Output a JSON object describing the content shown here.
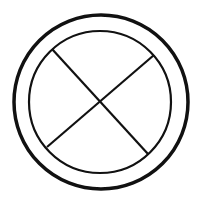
{
  "diagram": {
    "colors": {
      "stroke": "#111111",
      "background": "#ffffff"
    },
    "outer_circle": {
      "cx": 101,
      "cy": 102,
      "r": 87,
      "stroke_width": 3.5
    },
    "inner_circle": {
      "cx": 100,
      "cy": 102,
      "r": 71,
      "stroke_width": 2.2
    },
    "lines": [
      {
        "x1": 52,
        "y1": 49,
        "x2": 148,
        "y2": 154,
        "stroke_width": 2.2
      },
      {
        "x1": 154,
        "y1": 55,
        "x2": 47,
        "y2": 147,
        "stroke_width": 2.2
      }
    ]
  }
}
